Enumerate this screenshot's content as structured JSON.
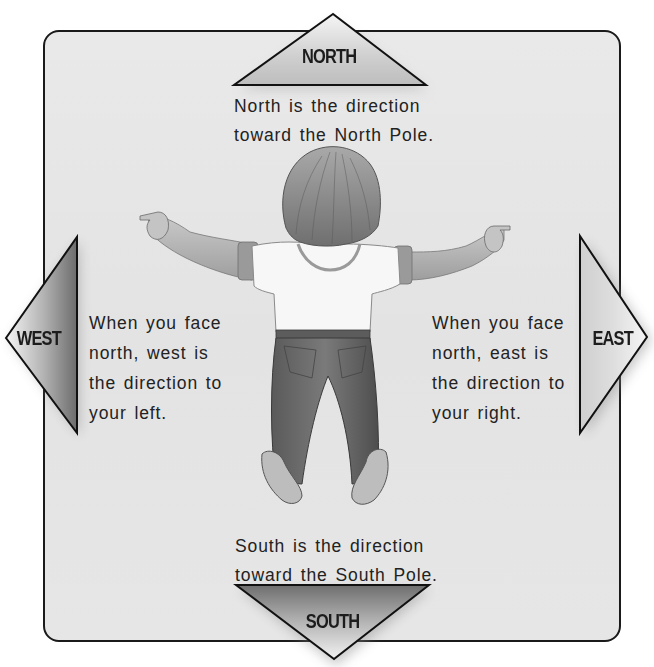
{
  "diagram": {
    "panel": {
      "background": "#e6e6e6",
      "border": "#1a1a1a"
    },
    "directions": {
      "north": {
        "label": "NORTH",
        "description_lines": [
          "North is the direction",
          "toward the North Pole."
        ]
      },
      "south": {
        "label": "SOUTH",
        "description_lines": [
          "South is the direction",
          "toward the South Pole."
        ]
      },
      "west": {
        "label": "WEST",
        "description_lines": [
          "When you face",
          "north, west is",
          "the direction to",
          "your left."
        ]
      },
      "east": {
        "label": "EAST",
        "description_lines": [
          "When you face",
          "north, east is",
          "the direction to",
          "your right."
        ]
      }
    },
    "figure": {
      "description": "Child seen from behind with arms outstretched, facing north"
    }
  }
}
